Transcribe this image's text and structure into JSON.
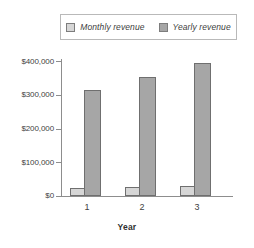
{
  "chart_data": {
    "type": "bar",
    "title": "",
    "xlabel": "Year",
    "ylabel": "",
    "categories": [
      "1",
      "2",
      "3"
    ],
    "series": [
      {
        "name": "Monthly revenue",
        "color": "#d6d6d6",
        "values": [
          25000,
          28000,
          30000
        ]
      },
      {
        "name": "Yearly revenue",
        "color": "#a6a6a6",
        "values": [
          315000,
          352000,
          394000
        ]
      }
    ],
    "ylim": [
      0,
      400000
    ],
    "ytick_values": [
      0,
      100000,
      200000,
      300000,
      400000
    ],
    "ytick_labels": [
      "$0",
      "$100,000",
      "$200,000",
      "$300,000",
      "$400,000"
    ],
    "grid": false,
    "legend_position": "top"
  },
  "legend": {
    "entries": [
      {
        "label": "Monthly revenue",
        "swatch": "monthly"
      },
      {
        "label": "Yearly revenue",
        "swatch": "yearly"
      }
    ]
  },
  "axes": {
    "x_title": "Year",
    "x_labels": [
      "1",
      "2",
      "3"
    ],
    "y_labels": [
      "$400,000",
      "$300,000",
      "$200,000",
      "$100,000",
      "$0"
    ]
  }
}
